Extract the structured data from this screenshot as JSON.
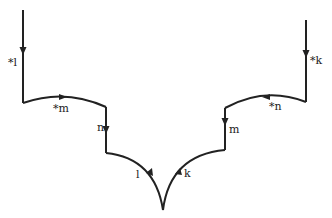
{
  "diagram": {
    "stroke_color": "#222222",
    "background": "#ffffff",
    "edges": [
      {
        "id": "left-vertical",
        "label": "*l",
        "direction": "down"
      },
      {
        "id": "left-upper-arc",
        "label": "*m",
        "direction": "right"
      },
      {
        "id": "left-inner-vertical",
        "label": "n",
        "direction": "down"
      },
      {
        "id": "left-lower-arc",
        "label": "l",
        "direction": "up"
      },
      {
        "id": "right-vertical",
        "label": "*k",
        "direction": "down"
      },
      {
        "id": "right-upper-arc",
        "label": "*n",
        "direction": "left"
      },
      {
        "id": "right-inner-vertical",
        "label": "m",
        "direction": "down"
      },
      {
        "id": "right-lower-arc",
        "label": "k",
        "direction": "up"
      }
    ]
  }
}
